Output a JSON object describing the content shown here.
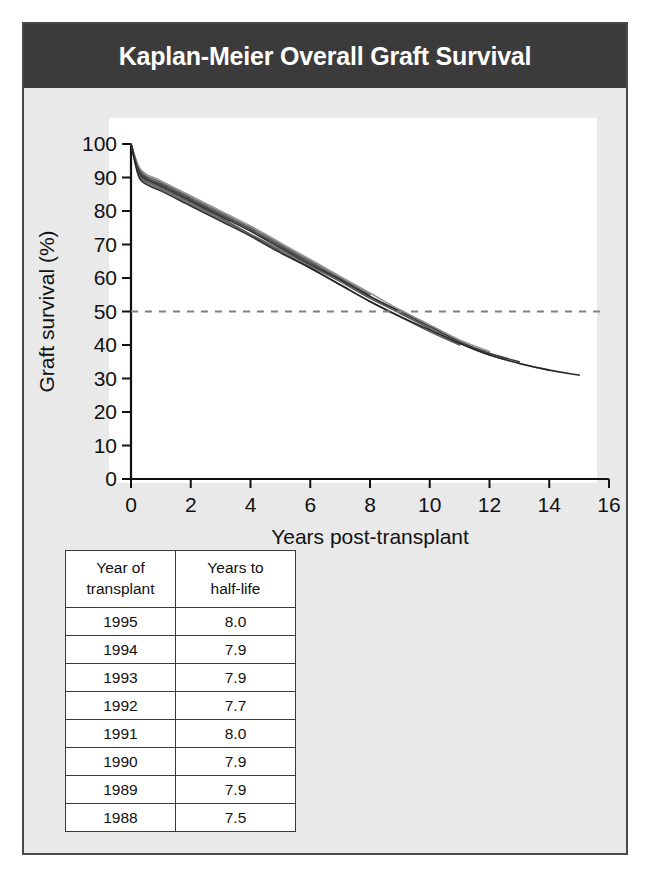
{
  "figure": {
    "title": "Kaplan-Meier Overall Graft Survival",
    "frame_color": "#4a4a4a",
    "title_bar_color": "#3b3b3b",
    "background_color": "#e9e9e9"
  },
  "chart_data": {
    "type": "line",
    "title": "Kaplan-Meier Overall Graft Survival",
    "xlabel": "Years post-transplant",
    "ylabel": "Graft survival (%)",
    "xlim": [
      0,
      16
    ],
    "ylim": [
      0,
      100
    ],
    "xticks": [
      0,
      2,
      4,
      6,
      8,
      10,
      12,
      14,
      16
    ],
    "yticks": [
      0,
      10,
      20,
      30,
      40,
      50,
      60,
      70,
      80,
      90,
      100
    ],
    "grid": false,
    "legend": "none",
    "annotations": [
      {
        "name": "half-life-reference-line",
        "type": "hline",
        "y": 50,
        "style": "dashed",
        "color": "#808080",
        "label": "50% graft survival (half-life)"
      }
    ],
    "x": [
      0,
      0.25,
      0.5,
      1,
      2,
      3,
      4,
      5,
      6,
      7,
      8,
      9,
      10,
      11,
      12,
      13,
      14,
      15
    ],
    "series": [
      {
        "name": "1995",
        "color": "#555555",
        "values": [
          100,
          93.0,
          90.5,
          88.5,
          84.0,
          79.5,
          75.0,
          70.0,
          65.0,
          60.0,
          55.0,
          null,
          null,
          null,
          null,
          null,
          null,
          null
        ]
      },
      {
        "name": "1994",
        "color": "#3a3a3a",
        "values": [
          100,
          92.5,
          90.0,
          88.0,
          83.5,
          79.0,
          74.5,
          69.5,
          64.5,
          59.5,
          54.5,
          50.0,
          null,
          null,
          null,
          null,
          null,
          null
        ]
      },
      {
        "name": "1993",
        "color": "#6b6b6b",
        "values": [
          100,
          92.0,
          89.5,
          87.5,
          83.0,
          78.5,
          74.0,
          69.0,
          64.0,
          59.0,
          54.0,
          49.5,
          45.0,
          null,
          null,
          null,
          null,
          null
        ]
      },
      {
        "name": "1992",
        "color": "#4a4a4a",
        "values": [
          100,
          91.5,
          89.0,
          87.0,
          82.5,
          78.0,
          73.0,
          68.0,
          63.0,
          58.0,
          53.0,
          48.5,
          44.0,
          40.0,
          null,
          null,
          null,
          null
        ]
      },
      {
        "name": "1991",
        "color": "#8a8a8a",
        "values": [
          100,
          93.5,
          91.0,
          89.0,
          84.5,
          80.0,
          75.5,
          70.5,
          65.5,
          60.5,
          55.5,
          50.5,
          46.0,
          41.5,
          38.0,
          null,
          null,
          null
        ]
      },
      {
        "name": "1990",
        "color": "#2f2f2f",
        "values": [
          100,
          92.0,
          89.5,
          87.5,
          83.0,
          78.5,
          74.0,
          69.0,
          64.0,
          59.5,
          54.5,
          50.0,
          45.5,
          41.0,
          37.5,
          35.0,
          null,
          null
        ]
      },
      {
        "name": "1989",
        "color": "#5e5e5e",
        "values": [
          100,
          91.0,
          88.5,
          86.5,
          82.0,
          77.5,
          73.0,
          68.5,
          63.5,
          59.0,
          54.0,
          49.5,
          45.0,
          40.5,
          37.0,
          34.5,
          32.5,
          null
        ]
      },
      {
        "name": "1988",
        "color": "#1f1f1f",
        "values": [
          100,
          90.5,
          88.0,
          86.0,
          81.5,
          77.0,
          72.5,
          67.5,
          63.0,
          58.0,
          53.0,
          48.5,
          44.5,
          40.5,
          37.0,
          34.5,
          32.5,
          31.0
        ]
      }
    ]
  },
  "table": {
    "headers": [
      "Year of transplant",
      "Years to half-life"
    ],
    "header_lines": [
      [
        "Year of",
        "transplant"
      ],
      [
        "Years to",
        "half-life"
      ]
    ],
    "rows": [
      {
        "year": "1995",
        "half_life": "8.0"
      },
      {
        "year": "1994",
        "half_life": "7.9"
      },
      {
        "year": "1993",
        "half_life": "7.9"
      },
      {
        "year": "1992",
        "half_life": "7.7"
      },
      {
        "year": "1991",
        "half_life": "8.0"
      },
      {
        "year": "1990",
        "half_life": "7.9"
      },
      {
        "year": "1989",
        "half_life": "7.9"
      },
      {
        "year": "1988",
        "half_life": "7.5"
      }
    ]
  }
}
